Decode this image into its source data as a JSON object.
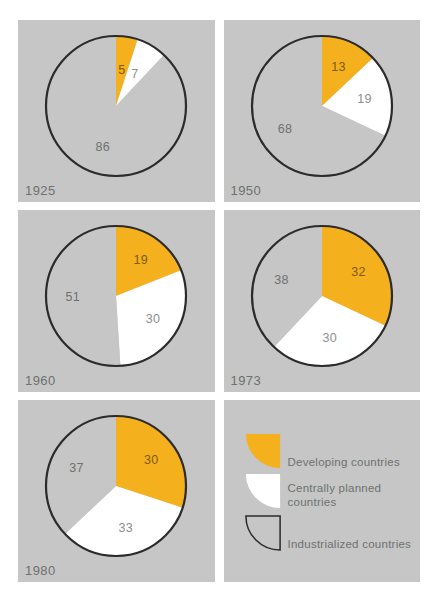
{
  "figure": {
    "background_color": "#ffffff",
    "panel_color": "#c5c6c5",
    "colors": {
      "developing": "#f5b01e",
      "centrally_planned": "#ffffff",
      "industrialized": "#c5c6c5",
      "outline": "#2b2b2b",
      "label_gray": "#6e7170",
      "label_on_orange": "#7a5c0c"
    }
  },
  "chart_data": {
    "type": "pie",
    "legend_position": "bottom-right",
    "categories": [
      "Developing countries",
      "Centrally planned countries",
      "Industrialized countries"
    ],
    "series": [
      {
        "name": "1925",
        "values": [
          5,
          7,
          86
        ]
      },
      {
        "name": "1950",
        "values": [
          13,
          19,
          68
        ]
      },
      {
        "name": "1960",
        "values": [
          19,
          30,
          51
        ]
      },
      {
        "name": "1973",
        "values": [
          32,
          30,
          38
        ]
      },
      {
        "name": "1980",
        "values": [
          30,
          33,
          37
        ]
      }
    ],
    "units": "percent",
    "start_angle_deg": 0,
    "direction": "clockwise"
  },
  "panels": [
    {
      "year": "1925",
      "slices": [
        {
          "key": "developing",
          "label": "5",
          "value": 5,
          "color": "#f5b01e"
        },
        {
          "key": "centrally_planned",
          "label": "7",
          "value": 7,
          "color": "#ffffff"
        },
        {
          "key": "industrialized",
          "label": "86",
          "value": 86,
          "color": "#c5c6c5"
        }
      ]
    },
    {
      "year": "1950",
      "slices": [
        {
          "key": "developing",
          "label": "13",
          "value": 13,
          "color": "#f5b01e"
        },
        {
          "key": "centrally_planned",
          "label": "19",
          "value": 19,
          "color": "#ffffff"
        },
        {
          "key": "industrialized",
          "label": "68",
          "value": 68,
          "color": "#c5c6c5"
        }
      ]
    },
    {
      "year": "1960",
      "slices": [
        {
          "key": "developing",
          "label": "19",
          "value": 19,
          "color": "#f5b01e"
        },
        {
          "key": "centrally_planned",
          "label": "30",
          "value": 30,
          "color": "#ffffff"
        },
        {
          "key": "industrialized",
          "label": "51",
          "value": 51,
          "color": "#c5c6c5"
        }
      ]
    },
    {
      "year": "1973",
      "slices": [
        {
          "key": "developing",
          "label": "32",
          "value": 32,
          "color": "#f5b01e"
        },
        {
          "key": "centrally_planned",
          "label": "30",
          "value": 30,
          "color": "#ffffff"
        },
        {
          "key": "industrialized",
          "label": "38",
          "value": 38,
          "color": "#c5c6c5"
        }
      ]
    },
    {
      "year": "1980",
      "slices": [
        {
          "key": "developing",
          "label": "30",
          "value": 30,
          "color": "#f5b01e"
        },
        {
          "key": "centrally_planned",
          "label": "33",
          "value": 33,
          "color": "#ffffff"
        },
        {
          "key": "industrialized",
          "label": "37",
          "value": 37,
          "color": "#c5c6c5"
        }
      ]
    }
  ],
  "legend": {
    "items": [
      {
        "label": "Developing countries",
        "color": "#f5b01e",
        "swatch": "quarter-circle-filled"
      },
      {
        "label": "Centrally planned\ncountries",
        "color": "#ffffff",
        "swatch": "quarter-circle-filled"
      },
      {
        "label": "Industrialized countries",
        "color": "#c5c6c5",
        "swatch": "quarter-circle-outline"
      }
    ]
  },
  "margin_note": ""
}
